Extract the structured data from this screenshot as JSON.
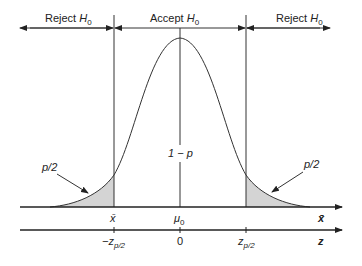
{
  "diagram": {
    "type": "two-tailed hypothesis test on normal distribution",
    "regions": {
      "left": {
        "label": "Reject",
        "symbol": "H",
        "sub": "0"
      },
      "center": {
        "label": "Accept",
        "symbol": "H",
        "sub": "0"
      },
      "right": {
        "label": "Reject",
        "symbol": "H",
        "sub": "0"
      }
    },
    "center_label": "1 − p",
    "tail_labels": {
      "left": "p/2",
      "right": "p/2"
    },
    "xbar_axis": {
      "name": "x̄",
      "ticks": [
        {
          "label": "x̄",
          "pos": "left-critical"
        },
        {
          "label": "μ",
          "sub": "0",
          "pos": "center"
        }
      ]
    },
    "z_axis": {
      "name": "z",
      "ticks": [
        {
          "label": "−z",
          "sub": "p/2",
          "pos": "left-critical"
        },
        {
          "label": "0",
          "pos": "center"
        },
        {
          "label": "z",
          "sub": "p/2",
          "pos": "right-critical"
        }
      ]
    },
    "colors": {
      "line": "#222222",
      "shade": "#d4d4d4"
    }
  }
}
